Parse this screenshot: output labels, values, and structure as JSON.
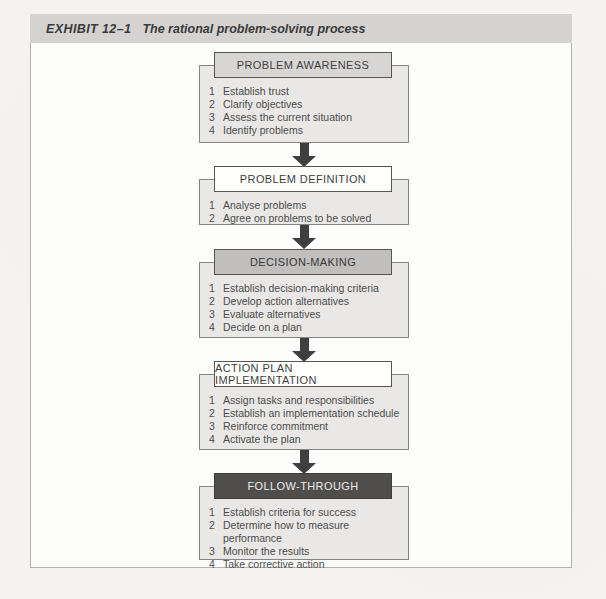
{
  "exhibit": {
    "label": "EXHIBIT 12–1",
    "title": "The rational problem-solving process"
  },
  "flow": {
    "stages": [
      {
        "title": "PROBLEM AWARENESS",
        "header_bg": "#d7d6d4",
        "header_text_color": "#3e3e3e",
        "items": [
          {
            "num": "1",
            "text": "Establish trust"
          },
          {
            "num": "2",
            "text": "Clarify objectives"
          },
          {
            "num": "3",
            "text": "Assess the current situation"
          },
          {
            "num": "4",
            "text": "Identify problems"
          }
        ]
      },
      {
        "title": "PROBLEM DEFINITION",
        "header_bg": "#ffffff",
        "header_text_color": "#3e3e3e",
        "items": [
          {
            "num": "1",
            "text": "Analyse problems"
          },
          {
            "num": "2",
            "text": "Agree on problems to be solved"
          }
        ]
      },
      {
        "title": "DECISION-MAKING",
        "header_bg": "#c0bfbd",
        "header_text_color": "#383838",
        "items": [
          {
            "num": "1",
            "text": "Establish decision-making criteria"
          },
          {
            "num": "2",
            "text": "Develop action alternatives"
          },
          {
            "num": "3",
            "text": "Evaluate alternatives"
          },
          {
            "num": "4",
            "text": "Decide on a plan"
          }
        ]
      },
      {
        "title": "ACTION PLAN IMPLEMENTATION",
        "header_bg": "#ffffff",
        "header_text_color": "#3e3e3e",
        "items": [
          {
            "num": "1",
            "text": "Assign tasks and responsibilities"
          },
          {
            "num": "2",
            "text": "Establish an implementation schedule"
          },
          {
            "num": "3",
            "text": "Reinforce commitment"
          },
          {
            "num": "4",
            "text": "Activate the plan"
          }
        ]
      },
      {
        "title": "FOLLOW-THROUGH",
        "header_bg": "#4f4e4d",
        "header_text_color": "#ebebea",
        "items": [
          {
            "num": "1",
            "text": "Establish criteria for success"
          },
          {
            "num": "2",
            "text": "Determine how to measure performance"
          },
          {
            "num": "3",
            "text": "Monitor the results"
          },
          {
            "num": "4",
            "text": "Take corrective action"
          }
        ]
      }
    ],
    "connector": "down-arrow",
    "colors": {
      "titlebar_bg": "#d4d3d1",
      "stage_body_bg": "#e9e8e6",
      "stage_body_border": "#848484",
      "arrow": "#3f3f3f",
      "item_text": "#4c4c4c",
      "panel_border": "#b3b2b0"
    }
  }
}
